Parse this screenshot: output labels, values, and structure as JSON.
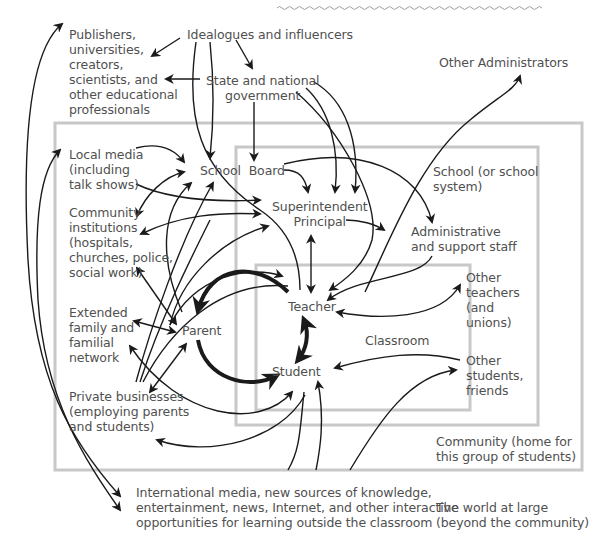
{
  "diagram": {
    "type": "nested-context-influence-map",
    "colors": {
      "text": "#505050",
      "arrows": "#1a1a1a",
      "boxes": "#c8c8c8",
      "wavy_rule": "#a0a0a0"
    },
    "nodes": {
      "publishers": "Publishers,\nuniversities,\ncreators,\nscientists, and\nother educational\nprofessionals",
      "idealogues": "Idealogues and influencers",
      "state_gov": "State and national\ngovernment",
      "other_admins": "Other Administrators",
      "local_media": "Local media\n(including\ntalk shows)",
      "school_board": "School  Board",
      "school_system": "School (or school\nsystem)",
      "community_institutions": "Community\ninstitutions\n(hospitals,\nchurches, police,\nsocial work)",
      "superintendent": "Superintendent\nPrincipal",
      "admin_staff": "Administrative\nand support staff",
      "other_teachers": "Other\nteachers\n(and\nunions)",
      "teacher": "Teacher",
      "extended_family": "Extended\nfamily and\nfamilial\nnetwork",
      "parent": "Parent",
      "classroom": "Classroom",
      "student": "Student",
      "other_students": "Other\nstudents,\nfriends",
      "private_business": "Private businesses\n(employing parents\nand students)",
      "community": "Community (home for\nthis group of students)",
      "international_media": "International media, new sources of knowledge,\nentertainment, news, Internet, and other interactive\nopportunities for learning outside the classroom",
      "world": "The world at large\n(beyond the community)"
    },
    "regions": [
      {
        "name": "Community",
        "x": 55,
        "y": 123,
        "w": 527,
        "h": 347
      },
      {
        "name": "School (or school system)",
        "x": 236,
        "y": 147,
        "w": 302,
        "h": 278
      },
      {
        "name": "Classroom",
        "x": 256,
        "y": 265,
        "w": 214,
        "h": 145
      }
    ],
    "relationships": [
      [
        "Idealogues and influencers",
        "Publishers"
      ],
      [
        "Idealogues and influencers",
        "State and national government"
      ],
      [
        "State and national government",
        "Publishers"
      ],
      [
        "State and national government",
        "School Board"
      ],
      [
        "School Board",
        "Superintendent/Principal"
      ],
      [
        "School Board",
        "Administrative and support staff"
      ],
      [
        "Superintendent/Principal",
        "Teacher"
      ],
      [
        "Superintendent/Principal",
        "Administrative and support staff"
      ],
      [
        "Administrative and support staff",
        "Teacher"
      ],
      [
        "Teacher",
        "Other teachers (and unions)"
      ],
      [
        "Teacher",
        "Student"
      ],
      [
        "Parent",
        "Teacher"
      ],
      [
        "Student",
        "Parent"
      ],
      [
        "Other students, friends",
        "Student"
      ],
      [
        "Local media",
        "School Board"
      ],
      [
        "Community institutions",
        "Parent"
      ],
      [
        "Extended family",
        "Parent"
      ],
      [
        "Private businesses",
        "Parent"
      ],
      [
        "Student",
        "International media"
      ]
    ]
  }
}
